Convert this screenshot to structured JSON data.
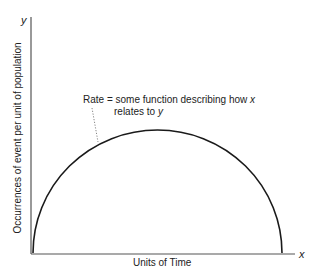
{
  "diagram": {
    "y_axis": {
      "variable": "y",
      "label": "Occurrences of event per unit of population"
    },
    "x_axis": {
      "variable": "x",
      "label": "Units of Time"
    },
    "annotation": {
      "line1_prefix": "Rate = some function describing how ",
      "line1_var": "x",
      "line2_prefix": "relates to ",
      "line2_var": "y"
    },
    "curve": {
      "shape": "half-ellipse arc",
      "start": [
        33,
        253
      ],
      "peak": [
        157,
        130
      ],
      "end": [
        282,
        253
      ]
    },
    "colors": {
      "curve": "#1a1a1a",
      "axes": "#555555",
      "leader": "#777777",
      "text": "#222222"
    }
  }
}
